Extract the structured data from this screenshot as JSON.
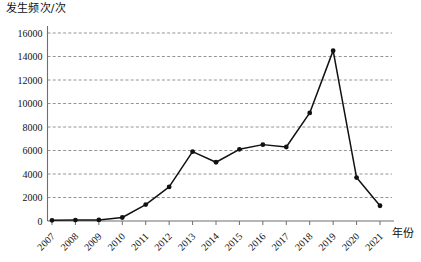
{
  "chart_data": {
    "type": "line",
    "title": "",
    "xlabel": "年份",
    "ylabel": "发生频次/次",
    "categories": [
      "2007",
      "2008",
      "2009",
      "2010",
      "2011",
      "2012",
      "2013",
      "2014",
      "2015",
      "2016",
      "2017",
      "2018",
      "2019",
      "2020",
      "2021"
    ],
    "values": [
      60,
      80,
      90,
      300,
      1400,
      2900,
      5900,
      5000,
      6100,
      6500,
      6300,
      9200,
      14500,
      3700,
      1300
    ],
    "series": [
      {
        "name": "发生频次",
        "values": [
          60,
          80,
          90,
          300,
          1400,
          2900,
          5900,
          5000,
          6100,
          6500,
          6300,
          9200,
          14500,
          3700,
          1300
        ]
      }
    ],
    "ylim": [
      0,
      16000
    ],
    "ytick_labels": [
      "0",
      "2000",
      "4000",
      "6000",
      "8000",
      "10000",
      "12000",
      "14000",
      "16000"
    ],
    "ytick_values": [
      0,
      2000,
      4000,
      6000,
      8000,
      10000,
      12000,
      14000,
      16000
    ],
    "grid": true,
    "grid_style": "dashed-horizontal",
    "legend": "none",
    "marker": "filled-circle",
    "line_color": "#111111",
    "grid_color": "#7a7a7a",
    "axis_color": "#6e6e6e",
    "background_color": "#ffffff",
    "xtick_label_rotation": 45
  }
}
